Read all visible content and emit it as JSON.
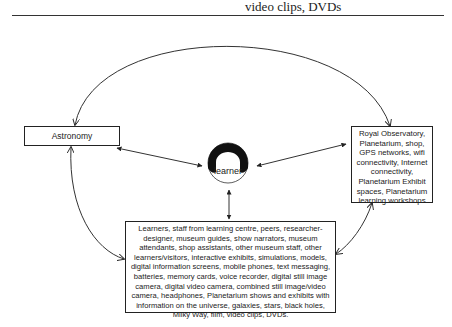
{
  "header": {
    "fragment_text": "video clips, DVDs"
  },
  "diagram": {
    "center": {
      "label": "learner"
    },
    "nodes": {
      "astronomy": {
        "label": "Astronomy"
      },
      "resources": {
        "label": "Royal Observatory, Planetarium, shop, GPS networks, wifi connectivity, Internet connectivity, Planetarium Exhibit spaces, Planetarium learning workshops"
      },
      "people": {
        "label": "Learners, staff from learning centre, peers, researcher-designer, museum guides, show narrators, museum attendants, shop assistants, other museum staff, other learners/visitors, interactive exhibits, simulations, models, digital information screens, mobile phones, text messaging, batteries, memory cards, voice recorder, digital still image camera, digital video camera, combined still image/video camera, headphones, Planetarium shows and exhibits with information on the universe, galaxies, stars, black holes, Milky Way, film, video clips, DVDs."
      }
    },
    "edges": [
      {
        "from": "astronomy",
        "to": "resources",
        "type": "curved-arrow-both"
      },
      {
        "from": "astronomy",
        "to": "people",
        "type": "curved-arrow-both"
      },
      {
        "from": "resources",
        "to": "people",
        "type": "curved-arrow-both"
      },
      {
        "from": "astronomy",
        "to": "learner",
        "type": "straight-arrow-both"
      },
      {
        "from": "resources",
        "to": "learner",
        "type": "straight-arrow-both"
      },
      {
        "from": "people",
        "to": "learner",
        "type": "straight-arrow-both"
      }
    ]
  }
}
